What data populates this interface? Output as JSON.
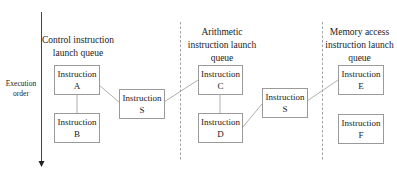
{
  "diagram": {
    "axis": {
      "label_line1": "Execution",
      "label_line2": "order"
    },
    "queues": [
      {
        "title_line1": "Control instruction",
        "title_line2": "launch queue",
        "title_line3": ""
      },
      {
        "title_line1": "Arithmetic",
        "title_line2": "instruction launch",
        "title_line3": "queue"
      },
      {
        "title_line1": "Memory access",
        "title_line2": "instruction launch",
        "title_line3": "queue"
      }
    ],
    "boxes": {
      "a": {
        "line1": "Instruction",
        "line2": "A"
      },
      "b": {
        "line1": "Instruction",
        "line2": "B"
      },
      "s1": {
        "line1": "Instruction",
        "line2": "S"
      },
      "c": {
        "line1": "Instruction",
        "line2": "C"
      },
      "d": {
        "line1": "Instruction",
        "line2": "D"
      },
      "s2": {
        "line1": "Instruction",
        "line2": "S"
      },
      "e": {
        "line1": "Instruction",
        "line2": "E"
      },
      "f": {
        "line1": "Instruction",
        "line2": "F"
      }
    },
    "colors": {
      "line": "#9a9a9a",
      "axis": "#444444",
      "text": "#222222"
    }
  }
}
